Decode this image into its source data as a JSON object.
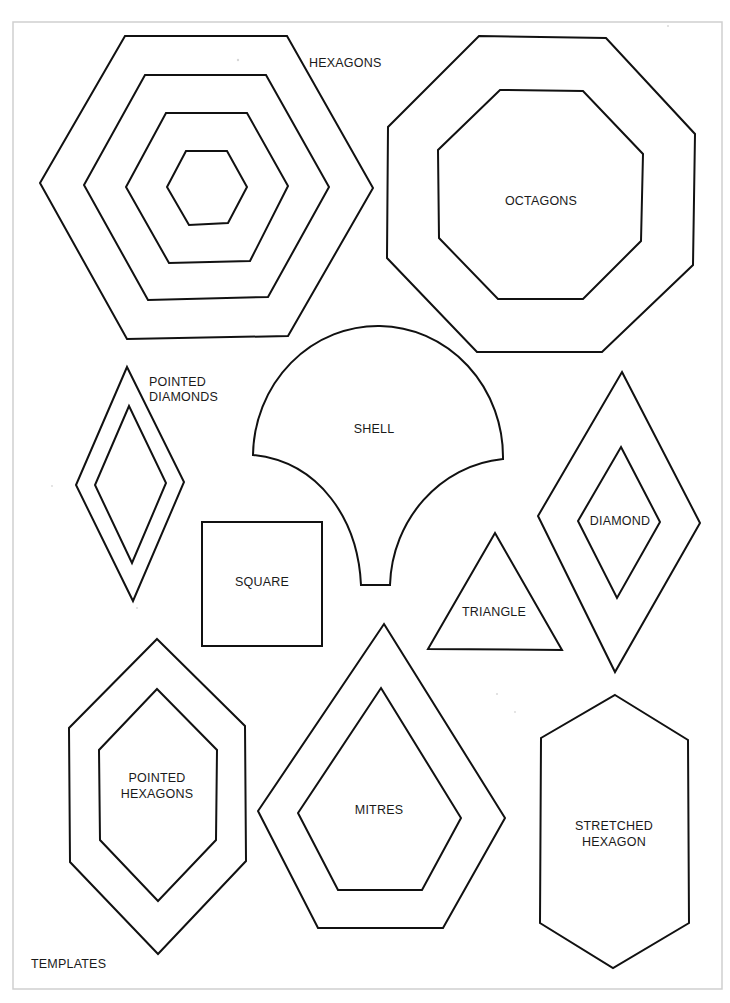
{
  "sheet": {
    "title": "TEMPLATES",
    "frame": {
      "x": 13,
      "y": 22,
      "width": 709,
      "height": 967,
      "color": "#cfcfcf"
    },
    "ink_color": "#111111"
  },
  "shapes": {
    "hexagons": {
      "label": "HEXAGONS",
      "rings": [
        "125,36 287,36 373,188 288,336 127,339 40,183",
        "145,75 266,75 329,187 268,297 148,300 84,185",
        "166,113 247,113 288,186 250,261 169,263 126,187",
        "186,151 227,151 247,187 228,223 189,225 167,187"
      ]
    },
    "octagons": {
      "label": "OCTAGONS",
      "rings": [
        "479,36 606,38 695,134 693,265 602,352 477,352 387,258 388,127",
        "500,90 583,91 643,154 641,241 583,299 498,299 439,238 438,150"
      ]
    },
    "pointed_diamonds": {
      "label_line_1": "POINTED",
      "label_line_2": "DIAMONDS",
      "rings": [
        "127,367 184,482 133,601 76,485",
        "129,406 166,483 132,563 95,485"
      ]
    },
    "shell": {
      "label": "SHELL",
      "path": "M 253 455 A 124 130 0 0 1 503 459 C 440 465 392 520 390 585 L 361 585 C 358 520 320 462 253 455 Z"
    },
    "square": {
      "label": "SQUARE",
      "x": 202,
      "y": 522,
      "width": 120,
      "height": 124
    },
    "triangle": {
      "label": "TRIANGLE",
      "points": "495,533 562,650 428,649"
    },
    "diamond": {
      "label": "DIAMOND",
      "rings": [
        "622,372 700,523 615,672 538,516",
        "621,447 660,522 617,598 578,521"
      ]
    },
    "pointed_hexagons": {
      "label_line_1": "POINTED",
      "label_line_2": "HEXAGONS",
      "rings": [
        "157,639 245,726 246,861 158,954 70,862 69,728",
        "157,689 217,750 216,840 158,901 100,840 99,750"
      ]
    },
    "mitres": {
      "label": "MITRES",
      "rings": [
        "384,624 505,818 443,928 318,928 258,811",
        "381,688 461,818 422,890 338,890 298,813"
      ]
    },
    "stretched_hexagon": {
      "label_line_1": "STRETCHED",
      "label_line_2": "HEXAGON",
      "points": "615,695 688,740 689,923 613,968 540,923 541,738"
    }
  }
}
